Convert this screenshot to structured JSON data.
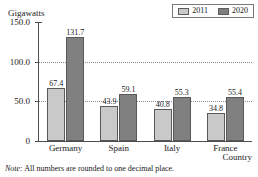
{
  "clipped_title_remnant": "",
  "note": {
    "tag": "Note:",
    "text": "All numbers are rounded to one decimal place."
  },
  "legend": {
    "entries": [
      {
        "label": "2011",
        "color": "#c9c9c9"
      },
      {
        "label": "2020",
        "color": "#808080"
      }
    ]
  },
  "axis": {
    "y_title": "Gigawatts",
    "x_title": "Country",
    "y_ticks": [
      "150.0",
      "100.0",
      "50.0",
      "0"
    ]
  },
  "chart_data": {
    "type": "bar",
    "title": "",
    "xlabel": "Country",
    "ylabel": "Gigawatts",
    "ylim": [
      0,
      150
    ],
    "yticks": [
      0,
      50,
      100,
      150
    ],
    "ytick_labels": [
      "0",
      "50.0",
      "100.0",
      "150.0"
    ],
    "grid": "horizontal-dotted-at-50-and-100",
    "legend_position": "top-right",
    "categories": [
      "Germany",
      "Spain",
      "Italy",
      "France"
    ],
    "series": [
      {
        "name": "2011",
        "color": "#c9c9c9",
        "values": [
          67.4,
          43.9,
          40.8,
          34.8
        ],
        "value_labels": [
          "67.4",
          "43.9",
          "40.8",
          "34.8"
        ]
      },
      {
        "name": "2020",
        "color": "#808080",
        "values": [
          131.7,
          59.1,
          55.3,
          55.4
        ],
        "value_labels": [
          "131.7",
          "59.1",
          "55.3",
          "55.4"
        ]
      }
    ],
    "annotations": [
      "Note: All numbers are rounded to one decimal place."
    ]
  }
}
